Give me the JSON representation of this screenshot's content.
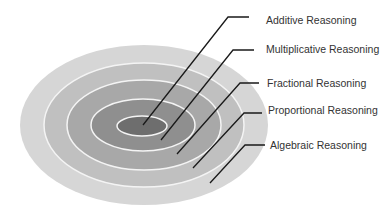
{
  "diagram": {
    "type": "concentric-ellipses",
    "levels": [
      {
        "label": "Additive Reasoning",
        "fill": "#6e6e6e"
      },
      {
        "label": "Multiplicative Reasoning",
        "fill": "#8f8f8f"
      },
      {
        "label": "Fractional Reasoning",
        "fill": "#a8a8a8"
      },
      {
        "label": "Proportional Reasoning",
        "fill": "#c0c0c0"
      },
      {
        "label": "Algebraic Reasoning",
        "fill": "#d6d6d6"
      }
    ],
    "ring_stroke": "#f4f4f4",
    "leader_color": "#1a1a1a"
  }
}
